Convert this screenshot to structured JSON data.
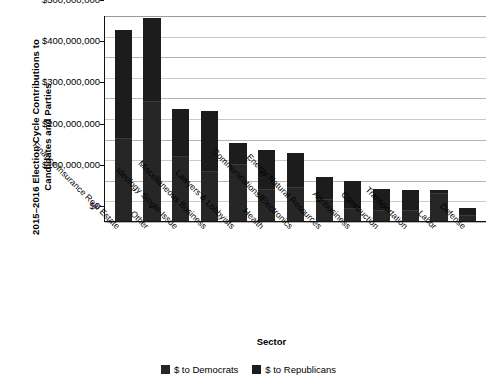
{
  "chart_data": {
    "type": "bar",
    "title": "",
    "subtitle": "",
    "xlabel": "Sector",
    "ylabel": "2015–2016 Election Cycle Contributions to Candidates and Parties",
    "ylim": [
      0,
      500000000
    ],
    "ytick_labels": [
      "$500,000,000",
      "$400,000,000",
      "$300,000,000",
      "$200,000,000",
      "$100,000,000",
      "$0"
    ],
    "ytick_values": [
      500000000,
      400000000,
      300000000,
      200000000,
      100000000,
      0
    ],
    "grid": true,
    "minor_gridlines": true,
    "legend_position": "bottom",
    "stacked": true,
    "categories": [
      "Finance Insurance Real Estate",
      "Other",
      "Ideology Single-Issue",
      "Miscellaneous Business",
      "Lawyers & Lobbyists",
      "Health",
      "Communications/Electronics",
      "Energy Natural Resources",
      "Agribusiness",
      "Construction",
      "Transportation",
      "Labor",
      "Defense"
    ],
    "series": [
      {
        "name": "$ to Democrats",
        "color": "#262626",
        "values": [
          200000000,
          290000000,
          155000000,
          120000000,
          135000000,
          75000000,
          80000000,
          50000000,
          30000000,
          25000000,
          25000000,
          65000000,
          13000000
        ]
      },
      {
        "name": "$ to Republicans",
        "color": "#1c1c1c",
        "values": [
          262000000,
          200000000,
          115000000,
          145000000,
          53000000,
          95000000,
          83000000,
          55000000,
          65000000,
          50000000,
          48000000,
          7000000,
          17000000
        ]
      }
    ],
    "totals": [
      462000000,
      490000000,
      270000000,
      265000000,
      188000000,
      170000000,
      163000000,
      105000000,
      95000000,
      75000000,
      73000000,
      72000000,
      30000000
    ]
  },
  "legend": {
    "items": [
      {
        "label": "$ to Democrats",
        "color": "#262626"
      },
      {
        "label": "$ to Republicans",
        "color": "#1c1c1c"
      }
    ]
  }
}
